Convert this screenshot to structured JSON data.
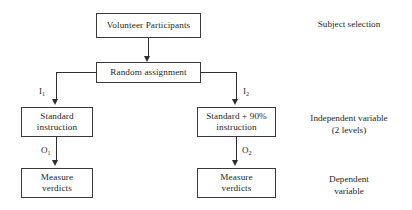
{
  "diagram": {
    "nodes": {
      "volunteer": {
        "line1": "Volunteer Participants"
      },
      "random": {
        "line1": "Random assignment"
      },
      "standard": {
        "line1": "Standard",
        "line2": "instruction"
      },
      "standard90": {
        "line1": "Standard + 90%",
        "line2": "instruction"
      },
      "measure1": {
        "line1": "Measure",
        "line2": "verdicts"
      },
      "measure2": {
        "line1": "Measure",
        "line2": "verdicts"
      }
    },
    "edge_labels": {
      "i1_base": "I",
      "i1_sub": "1",
      "i2_base": "I",
      "i2_sub": "2",
      "o1_base": "O",
      "o1_sub": "1",
      "o2_base": "O",
      "o2_sub": "2"
    },
    "annotations": {
      "subject_selection": {
        "line1": "Subject selection"
      },
      "independent_variable": {
        "line1": "Independent variable",
        "line2": "(2 levels)"
      },
      "dependent_variable": {
        "line1": "Dependent",
        "line2": "variable"
      }
    },
    "colors": {
      "background": "#ffffff",
      "box_border": "#3a3a3a",
      "connector": "#2e2e2e",
      "text": "#1f1f1f"
    }
  }
}
